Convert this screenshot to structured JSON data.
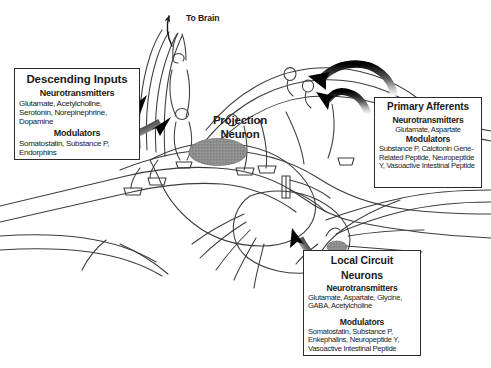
{
  "figure": {
    "background_color": "#ffffff",
    "line_color": "#3a3a3a",
    "box_border_color": "#2b2b2b",
    "arrow_color": "#111111",
    "soma_fill_color": "#8a8a8a"
  },
  "labels": {
    "to_brain": "To Brain",
    "projection_neuron": "Projection\nNeuron",
    "projection_neuron_line1": "Projection",
    "projection_neuron_line2": "Neuron"
  },
  "boxes": {
    "descending_inputs": {
      "title": "Descending Inputs",
      "sections": [
        {
          "heading": "Neurotransmitters",
          "body": "Glutamate, Acetylcholine, Serotonin, Norepinephrine, Dopamine"
        },
        {
          "heading": "Modulators",
          "body": "Somatostatin, Substance P, Endorphins"
        }
      ]
    },
    "primary_afferents": {
      "title": "Primary Afferents",
      "sections": [
        {
          "heading": "Neurotransmitters",
          "body": "Glutamate, Aspartate"
        },
        {
          "heading": "Modulators",
          "body": "Substance P, Calcitonin Gene-Related Peptide, Neuropeptide Y, Vasoactive Intestinal Peptide"
        }
      ]
    },
    "local_circuit_neurons": {
      "title_line1": "Local Circuit",
      "title_line2": "Neurons",
      "sections": [
        {
          "heading": "Neurotransmitters",
          "body": "Glutamate, Aspartate, Glycine, GABA, Acetylcholine"
        },
        {
          "heading": "Modulators",
          "body": "Somatostatin, Substance P, Enkephalins, Neuropeptide Y, Vasoactive Intestinal Peptide"
        }
      ]
    }
  },
  "arrows": [
    {
      "name": "descending-arrow-upper",
      "from": "descending-inputs-box",
      "to": "descending-fiber-tract"
    },
    {
      "name": "descending-arrow-lower",
      "from": "descending-inputs-box",
      "to": "descending-fiber-tract"
    },
    {
      "name": "primary-afferent-arrow-outer",
      "from": "primary-afferents-box",
      "to": "afferent-fiber-arch"
    },
    {
      "name": "primary-afferent-arrow-inner",
      "from": "primary-afferents-box",
      "to": "afferent-fiber-arch"
    },
    {
      "name": "local-circuit-arrow",
      "from": "local-circuit-neurons-box",
      "to": "interneuron-soma"
    },
    {
      "name": "to-brain-arrow",
      "from": "projection-axon",
      "to": "brain"
    }
  ]
}
